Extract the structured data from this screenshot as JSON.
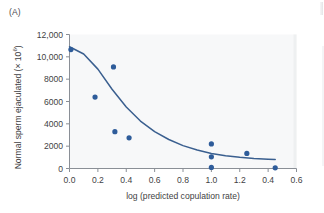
{
  "figure": {
    "panel_label": "(A)",
    "accent_color": "#2e5c9a",
    "curve_color": "#3a5f8f",
    "plot_bg_color": "#f7f8f9",
    "axis_color": "#8a8f96",
    "text_color": "#3f3f44"
  },
  "chart_data": {
    "type": "scatter",
    "title": "",
    "subtitle": "",
    "xlabel": "log (predicted copulation rate)",
    "ylabel": "Normal sperm ejaculated (× 10⁶)",
    "ylabel_base": "Normal sperm ejaculated (× 10",
    "ylabel_exponent": "6",
    "ylabel_tail": ")",
    "xlim": [
      0.0,
      1.6
    ],
    "ylim": [
      0,
      12000
    ],
    "grid": false,
    "legend": "none",
    "xtick_values": [
      0.0,
      0.2,
      0.4,
      0.6,
      0.8,
      1.0,
      1.2,
      1.4,
      1.6
    ],
    "xtick_labels": [
      "0.0",
      "0.2",
      "0.4",
      "0.6",
      "0.8",
      "1.0",
      "1.2",
      "0.4",
      "0.6"
    ],
    "ytick_values": [
      0,
      2000,
      4000,
      6000,
      8000,
      10000,
      12000
    ],
    "ytick_labels": [
      "0",
      "2000",
      "4000",
      "6000",
      "8000",
      "10,000",
      "12,000"
    ],
    "series": [
      {
        "name": "Normal sperm ejaculated",
        "type": "scatter",
        "marker": "circle",
        "color": "#2e5c9a",
        "x": [
          0.01,
          0.18,
          0.31,
          0.32,
          0.42,
          1.0,
          1.0,
          1.0,
          1.25,
          1.45
        ],
        "y": [
          10650,
          6400,
          9100,
          3300,
          2750,
          2200,
          1050,
          100,
          1350,
          60
        ]
      },
      {
        "name": "Fitted curve",
        "type": "line",
        "color": "#3a5f8f",
        "x": [
          0.0,
          0.1,
          0.2,
          0.3,
          0.4,
          0.5,
          0.6,
          0.7,
          0.8,
          0.9,
          1.0,
          1.1,
          1.2,
          1.3,
          1.4,
          1.45
        ],
        "y": [
          10900,
          10250,
          8900,
          7100,
          5500,
          4250,
          3300,
          2600,
          2050,
          1650,
          1350,
          1150,
          1000,
          900,
          830,
          800
        ]
      }
    ],
    "annotations": []
  }
}
